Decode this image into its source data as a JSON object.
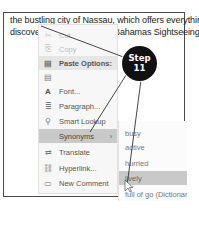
{
  "document": {
    "line1_left": "the bustling city of Nassau, which offers everything",
    "line2_left": "discover",
    "line2_right": "Bahamas Sightseeing"
  },
  "context_menu": {
    "items": [
      {
        "label": "Cut",
        "icon": "scissors-icon",
        "glyph": "✂",
        "state": "disabled"
      },
      {
        "label": "Copy",
        "icon": "copy-icon",
        "glyph": "⎘",
        "state": "disabled"
      },
      {
        "label": "Paste Options:",
        "icon": "paste-icon",
        "glyph": "📋",
        "state": "header"
      },
      {
        "label": "",
        "icon": "paste-keep-text-icon",
        "glyph": "📋",
        "state": "normal"
      },
      {
        "label": "Font...",
        "icon": "font-icon",
        "glyph": "A",
        "state": "normal"
      },
      {
        "label": "Paragraph...",
        "icon": "paragraph-icon",
        "glyph": "¶",
        "state": "normal"
      },
      {
        "label": "Smart Lookup",
        "icon": "search-icon",
        "glyph": "⚲",
        "state": "normal"
      },
      {
        "label": "Synonyms",
        "icon": "",
        "glyph": "",
        "state": "active",
        "submenu_arrow": "›"
      },
      {
        "label": "Translate",
        "icon": "translate-icon",
        "glyph": "⇄",
        "state": "normal"
      },
      {
        "label": "Hyperlink...",
        "icon": "hyperlink-icon",
        "glyph": "🔗",
        "state": "normal"
      },
      {
        "label": "New Comment",
        "icon": "comment-icon",
        "glyph": "▭",
        "state": "normal"
      }
    ]
  },
  "synonyms_submenu": {
    "items": [
      {
        "label": "busy",
        "state": "normal"
      },
      {
        "label": "active",
        "state": "normal"
      },
      {
        "label": "hurried",
        "state": "normal"
      },
      {
        "label": "lively",
        "state": "active"
      },
      {
        "label": "full of go (Dictionary)",
        "state": "normal"
      }
    ]
  },
  "callout": {
    "line1": "Step",
    "line2": "11",
    "color": "#111111"
  }
}
